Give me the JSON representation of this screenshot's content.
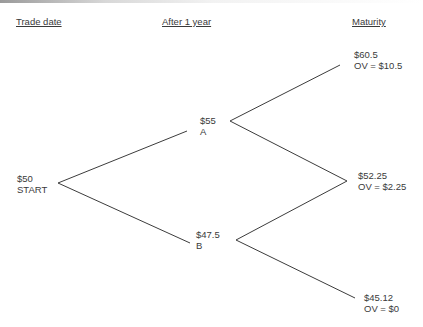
{
  "headers": {
    "trade_date": "Trade date",
    "after_1_year": "After 1 year",
    "maturity": "Maturity"
  },
  "nodes": {
    "start": {
      "price": "$50",
      "label": "START"
    },
    "a": {
      "price": "$55",
      "label": "A"
    },
    "b": {
      "price": "$47.5",
      "label": "B"
    },
    "up_up": {
      "price": "$60.5",
      "label": "OV = $10.5"
    },
    "middle": {
      "price": "$52.25",
      "label": "OV = $2.25"
    },
    "down_down": {
      "price": "$45.12",
      "label": "OV = $0"
    }
  },
  "colors": {
    "line": "#3c3c3c",
    "text": "#3a3a3a"
  }
}
